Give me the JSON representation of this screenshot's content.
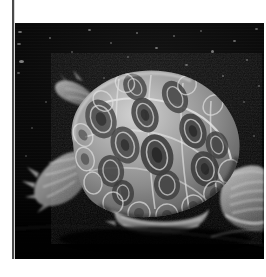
{
  "document": {
    "type": "photographic-plate",
    "page_background": "#ffffff",
    "margin_rule_color": "#4a4a4a"
  },
  "photo": {
    "subject": "turtle",
    "subject_detail": "freshwater turtle (painted turtle / slider) in side three-quarter view",
    "color_mode": "grayscale",
    "background_description": "dark water with scattered light specks",
    "background_color": "#080808",
    "shell_midtone": "#9a9a9a",
    "shell_highlight": "#d8d8d8",
    "shell_shadow": "#3a3a3a",
    "speck_color": "#cfcfcf",
    "frame": {
      "left": 15,
      "top": 23,
      "width": 249,
      "height": 236
    }
  },
  "specks": [
    {
      "x": 3,
      "y": 8,
      "w": 4,
      "h": 2,
      "o": 0.55
    },
    {
      "x": 2,
      "y": 20,
      "w": 4,
      "h": 2,
      "o": 0.48
    },
    {
      "x": 4,
      "y": 37,
      "w": 5,
      "h": 3,
      "o": 0.6
    },
    {
      "x": 2,
      "y": 49,
      "w": 3,
      "h": 2,
      "o": 0.4
    },
    {
      "x": 34,
      "y": 14,
      "w": 2,
      "h": 2,
      "o": 0.42
    },
    {
      "x": 56,
      "y": 28,
      "w": 2,
      "h": 2,
      "o": 0.35
    },
    {
      "x": 73,
      "y": 6,
      "w": 3,
      "h": 2,
      "o": 0.5
    },
    {
      "x": 95,
      "y": 19,
      "w": 2,
      "h": 2,
      "o": 0.38
    },
    {
      "x": 112,
      "y": 33,
      "w": 2,
      "h": 2,
      "o": 0.33
    },
    {
      "x": 121,
      "y": 9,
      "w": 2,
      "h": 2,
      "o": 0.45
    },
    {
      "x": 140,
      "y": 24,
      "w": 3,
      "h": 2,
      "o": 0.52
    },
    {
      "x": 158,
      "y": 12,
      "w": 2,
      "h": 2,
      "o": 0.4
    },
    {
      "x": 170,
      "y": 41,
      "w": 3,
      "h": 2,
      "o": 0.46
    },
    {
      "x": 185,
      "y": 7,
      "w": 2,
      "h": 2,
      "o": 0.37
    },
    {
      "x": 196,
      "y": 27,
      "w": 3,
      "h": 3,
      "o": 0.55
    },
    {
      "x": 207,
      "y": 52,
      "w": 2,
      "h": 2,
      "o": 0.42
    },
    {
      "x": 218,
      "y": 17,
      "w": 3,
      "h": 2,
      "o": 0.48
    },
    {
      "x": 231,
      "y": 36,
      "w": 2,
      "h": 2,
      "o": 0.4
    },
    {
      "x": 240,
      "y": 5,
      "w": 3,
      "h": 2,
      "o": 0.44
    },
    {
      "x": 243,
      "y": 62,
      "w": 2,
      "h": 2,
      "o": 0.38
    },
    {
      "x": 228,
      "y": 78,
      "w": 2,
      "h": 2,
      "o": 0.33
    },
    {
      "x": 212,
      "y": 96,
      "w": 2,
      "h": 2,
      "o": 0.3
    },
    {
      "x": 238,
      "y": 112,
      "w": 2,
      "h": 2,
      "o": 0.32
    },
    {
      "x": 30,
      "y": 78,
      "w": 2,
      "h": 2,
      "o": 0.3
    },
    {
      "x": 16,
      "y": 104,
      "w": 2,
      "h": 2,
      "o": 0.28
    },
    {
      "x": 10,
      "y": 132,
      "w": 2,
      "h": 2,
      "o": 0.26
    },
    {
      "x": 88,
      "y": 54,
      "w": 2,
      "h": 2,
      "o": 0.3
    },
    {
      "x": 150,
      "y": 58,
      "w": 2,
      "h": 2,
      "o": 0.28
    }
  ],
  "carapace_scutes": [
    {
      "cx": 86,
      "cy": 96,
      "rx": 15,
      "ry": 20,
      "rot": -22,
      "tone": "#4a4a4a"
    },
    {
      "cx": 110,
      "cy": 122,
      "rx": 14,
      "ry": 19,
      "rot": -18,
      "tone": "#454545"
    },
    {
      "cx": 96,
      "cy": 142,
      "rx": 13,
      "ry": 16,
      "rot": -12,
      "tone": "#3f3f3f"
    },
    {
      "cx": 128,
      "cy": 96,
      "rx": 13,
      "ry": 18,
      "rot": -20,
      "tone": "#3c3c3c"
    },
    {
      "cx": 140,
      "cy": 130,
      "rx": 16,
      "ry": 21,
      "rot": -16,
      "tone": "#383838"
    },
    {
      "cx": 160,
      "cy": 74,
      "rx": 12,
      "ry": 17,
      "rot": -26,
      "tone": "#424242"
    },
    {
      "cx": 176,
      "cy": 106,
      "rx": 13,
      "ry": 18,
      "rot": -20,
      "tone": "#3d3d3d"
    },
    {
      "cx": 188,
      "cy": 142,
      "rx": 14,
      "ry": 18,
      "rot": -14,
      "tone": "#3a3a3a"
    },
    {
      "cx": 120,
      "cy": 64,
      "rx": 11,
      "ry": 14,
      "rot": -30,
      "tone": "#464646"
    },
    {
      "cx": 150,
      "cy": 160,
      "rx": 13,
      "ry": 15,
      "rot": -8,
      "tone": "#3e3e3e"
    },
    {
      "cx": 108,
      "cy": 166,
      "rx": 11,
      "ry": 13,
      "rot": -6,
      "tone": "#3b3b3b"
    },
    {
      "cx": 200,
      "cy": 120,
      "rx": 11,
      "ry": 14,
      "rot": -18,
      "tone": "#3f3f3f"
    }
  ],
  "marginal_scutes": [
    {
      "cx": 60,
      "cy": 112,
      "rx": 9,
      "ry": 12,
      "rot": -30
    },
    {
      "cx": 62,
      "cy": 136,
      "rx": 9,
      "ry": 12,
      "rot": -18
    },
    {
      "cx": 72,
      "cy": 158,
      "rx": 9,
      "ry": 11,
      "rot": -8
    },
    {
      "cx": 92,
      "cy": 176,
      "rx": 10,
      "ry": 11,
      "rot": 2
    },
    {
      "cx": 118,
      "cy": 186,
      "rx": 11,
      "ry": 11,
      "rot": 6
    },
    {
      "cx": 146,
      "cy": 188,
      "rx": 11,
      "ry": 11,
      "rot": 8
    },
    {
      "cx": 174,
      "cy": 180,
      "rx": 11,
      "ry": 12,
      "rot": 14
    },
    {
      "cx": 198,
      "cy": 166,
      "rx": 11,
      "ry": 12,
      "rot": 22
    },
    {
      "cx": 214,
      "cy": 146,
      "rx": 10,
      "ry": 12,
      "rot": 30
    }
  ]
}
